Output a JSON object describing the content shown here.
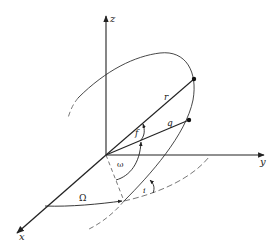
{
  "diagram": {
    "title": "",
    "colors": {
      "ink": "#222222",
      "background": "#ffffff"
    },
    "axes": {
      "x": {
        "label": "x"
      },
      "y": {
        "label": "y"
      },
      "z": {
        "label": "z"
      }
    },
    "vectors": {
      "r": {
        "label": "r"
      },
      "q": {
        "label": "q"
      }
    },
    "angles": {
      "true_anomaly": {
        "label": "f"
      },
      "argument_of_pericenter": {
        "label": "ω"
      },
      "longitude_of_ascending_node": {
        "label": "Ω"
      },
      "inclination": {
        "label": "i"
      }
    }
  }
}
